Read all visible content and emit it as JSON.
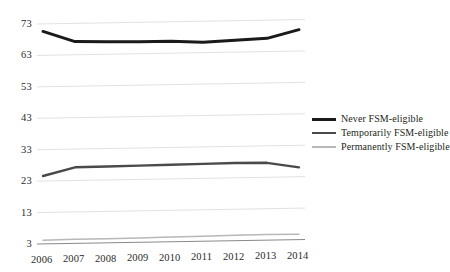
{
  "chart_data": {
    "type": "line",
    "title": "",
    "subtitle": "",
    "xlabel": "",
    "ylabel": "",
    "x": [
      2006,
      2007,
      2008,
      2009,
      2010,
      2011,
      2012,
      2013,
      2014
    ],
    "categories": [
      "2006",
      "2007",
      "2008",
      "2009",
      "2010",
      "2011",
      "2012",
      "2013",
      "2014"
    ],
    "ylim": [
      3,
      73
    ],
    "yticks": [
      3,
      13,
      23,
      33,
      43,
      53,
      63,
      73
    ],
    "ytick_labels": [
      "3",
      "13",
      "23",
      "33",
      "43",
      "53",
      "63",
      "73"
    ],
    "grid": true,
    "grid_axis": "y",
    "legend_position": "right",
    "series": [
      {
        "name": "Never FSM-eligible",
        "color": "#1a1a1a",
        "width": 3,
        "values": [
          70.6,
          67.2,
          67.0,
          66.8,
          66.8,
          66.3,
          66.8,
          67.2,
          69.8
        ]
      },
      {
        "name": "Temporarily FSM-eligible",
        "color": "#4a4a4a",
        "width": 2.4,
        "values": [
          24.6,
          27.2,
          27.3,
          27.4,
          27.5,
          27.6,
          27.7,
          27.6,
          26.0
        ]
      },
      {
        "name": "Permanently FSM-eligible",
        "color": "#b8b8b8",
        "width": 1.5,
        "values": [
          4.2,
          4.3,
          4.3,
          4.4,
          4.5,
          4.6,
          4.7,
          4.8,
          4.7
        ]
      }
    ]
  },
  "y_axis": {
    "ticks": [
      {
        "label": "73",
        "value": 73
      },
      {
        "label": "63",
        "value": 63
      },
      {
        "label": "53",
        "value": 53
      },
      {
        "label": "43",
        "value": 43
      },
      {
        "label": "33",
        "value": 33
      },
      {
        "label": "23",
        "value": 23
      },
      {
        "label": "13",
        "value": 13
      },
      {
        "label": "3",
        "value": 3
      }
    ]
  },
  "x_axis": {
    "ticks": [
      {
        "label": "2006"
      },
      {
        "label": "2007"
      },
      {
        "label": "2008"
      },
      {
        "label": "2009"
      },
      {
        "label": "2010"
      },
      {
        "label": "2011"
      },
      {
        "label": "2012"
      },
      {
        "label": "2013"
      },
      {
        "label": "2014"
      }
    ]
  },
  "legend": {
    "items": [
      {
        "label": "Never FSM-eligible"
      },
      {
        "label": "Temporarily FSM-eligible"
      },
      {
        "label": "Permanently FSM-eligible"
      }
    ]
  }
}
